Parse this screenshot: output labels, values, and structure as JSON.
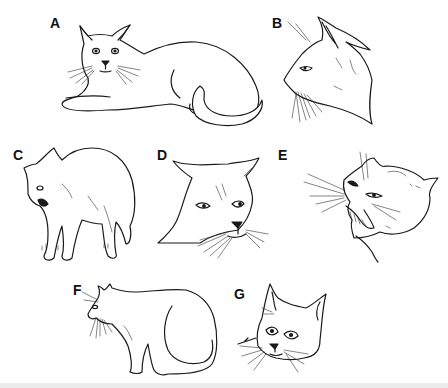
{
  "figure": {
    "background": "#ffffff",
    "line_color": "#1a1a1a",
    "bottom_strip_color": "#ececec",
    "panels": [
      {
        "label": "A",
        "description": "Relaxed cat lying down, body stretched, tail curled, ears forward, calm eyes"
      },
      {
        "label": "B",
        "description": "Cat head in profile, alert, ears upright and forward, whiskers forward"
      },
      {
        "label": "C",
        "description": "Standing cat with arched back, mouth open, defensive posture"
      },
      {
        "label": "D",
        "description": "Cat head facing forward with ears flattened sideways, narrowed eyes"
      },
      {
        "label": "E",
        "description": "Snarling cat head, ears flattened back, mouth open baring teeth"
      },
      {
        "label": "F",
        "description": "Crouched sitting cat, head lowered, body hunched"
      },
      {
        "label": "G",
        "description": "Cat head facing forward, ears upright, wide eyes"
      }
    ]
  }
}
